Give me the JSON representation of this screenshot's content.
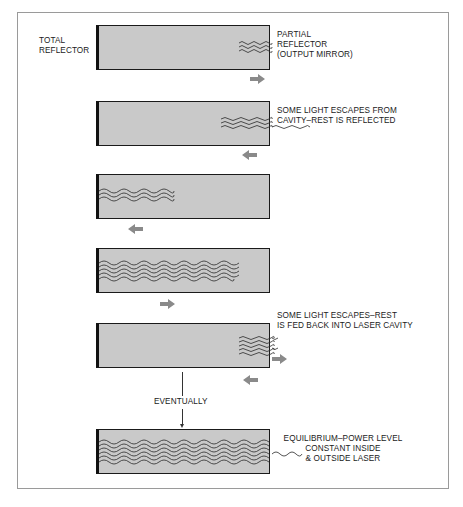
{
  "diagram": {
    "title_labels": {
      "total_reflector": "TOTAL\nREFLECTOR",
      "partial_reflector": "PARTIAL\nREFLECTOR\n(OUTPUT MIRROR)"
    },
    "stages": [
      {
        "id": 1,
        "caption": "",
        "wave_lines": 2,
        "wave_extent": "right edge only",
        "arrows": [
          "right"
        ]
      },
      {
        "id": 2,
        "caption": "SOME LIGHT ESCAPES FROM\nCAVITY–REST IS REFLECTED",
        "wave_lines": 3,
        "wave_extent": "right portion, one escaping wave",
        "arrows": [
          "left"
        ]
      },
      {
        "id": 3,
        "caption": "",
        "wave_lines": 3,
        "wave_extent": "left portion",
        "arrows": [
          "left"
        ]
      },
      {
        "id": 4,
        "caption": "",
        "wave_lines": 5,
        "wave_extent": "most of cavity",
        "arrows": [
          "right"
        ]
      },
      {
        "id": 5,
        "caption": "SOME LIGHT ESCAPES–REST\nIS FED BACK INTO LASER CAVITY",
        "wave_lines": 5,
        "wave_extent": "right portion, two escaping waves",
        "arrows": [
          "right",
          "left"
        ]
      },
      {
        "id": 6,
        "caption": "EQUILIBRIUM–POWER LEVEL\nCONSTANT INSIDE\n& OUTSIDE LASER",
        "wave_lines": 6,
        "wave_extent": "full cavity, one escaping wave",
        "arrows": []
      }
    ],
    "transition_label": "EVENTUALLY",
    "colors": {
      "cavity_fill": "#c9c9c9",
      "cavity_border": "#1a1a1a",
      "arrow": "#8a8a8a",
      "wave": "#2a2a2a",
      "frame": "#9a9a9a"
    }
  }
}
